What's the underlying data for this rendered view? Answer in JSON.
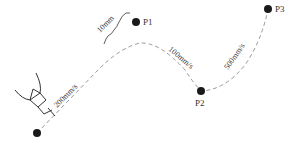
{
  "diagram": {
    "points": [
      {
        "id": "start",
        "label": "",
        "x": 37,
        "y": 133
      },
      {
        "id": "p1",
        "label": "P1",
        "x": 136,
        "y": 22
      },
      {
        "id": "p2",
        "label": "P2",
        "x": 201,
        "y": 91
      },
      {
        "id": "p3",
        "label": "P3",
        "x": 268,
        "y": 9
      }
    ],
    "labels": {
      "p1": "P1",
      "p2": "P2",
      "p3": "P3",
      "offset": "10mm",
      "speed1": "200mm/s",
      "speed2": "100mm/s",
      "speed3": "500mm/s"
    },
    "colors": {
      "point": "#1a1a1a",
      "path": "#999999",
      "tool": "#333333"
    }
  }
}
